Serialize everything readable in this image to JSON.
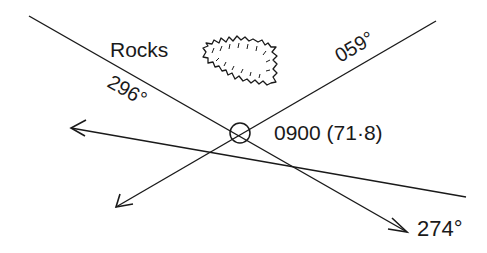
{
  "diagram": {
    "colors": {
      "ink": "#1a1a1a",
      "background": "#ffffff"
    },
    "labels": {
      "rocks": "Rocks",
      "bearing_296": "296°",
      "bearing_059": "059°",
      "fix": "0900 (71·8)",
      "bearing_274": "274°"
    },
    "lines": [
      {
        "name": "bearing-line-296",
        "bearing": "296°"
      },
      {
        "name": "bearing-line-059",
        "bearing": "059°"
      },
      {
        "name": "bearing-line-274",
        "bearing": "274°"
      }
    ],
    "fix_symbol": "circle-with-cross",
    "landmark": "rocks"
  }
}
